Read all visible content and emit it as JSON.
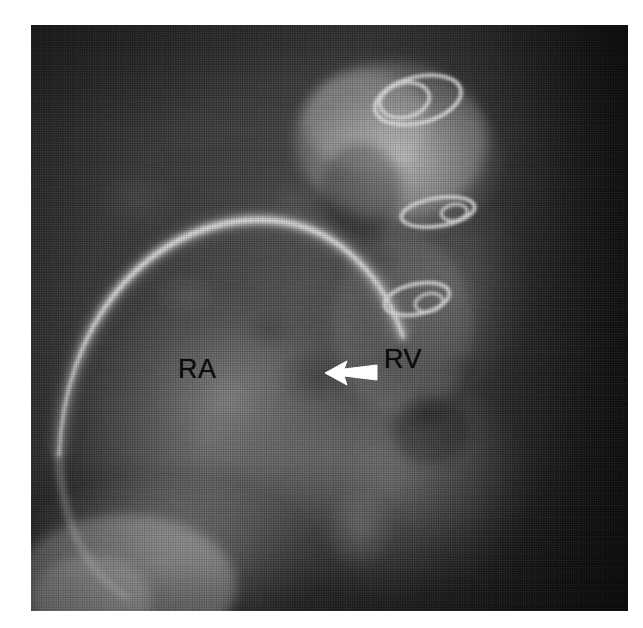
{
  "figure": {
    "kind": "radiograph",
    "modality_description": "grayscale angiocardiographic radiograph",
    "background_color": "#ffffff",
    "plate": {
      "x": 31,
      "y": 25,
      "width": 597,
      "height": 586,
      "base_color": "#3a3a3a"
    }
  },
  "annotations": {
    "labels": [
      {
        "id": "ra",
        "text": "RA",
        "meaning": "right atrium",
        "color": "#0b0b0b",
        "x": 147,
        "y": 331
      },
      {
        "id": "rv",
        "text": "RV",
        "meaning": "right ventricle",
        "color": "#0b0b0b",
        "x": 353,
        "y": 321
      }
    ],
    "arrow": {
      "id": "arrow-marker",
      "color": "#ffffff",
      "direction": "left",
      "x": 292,
      "y": 330,
      "width": 56,
      "height": 34
    }
  },
  "radiopaque_objects": [
    {
      "id": "wire-ring-1",
      "shape": "loop",
      "cx": 418,
      "cy": 100,
      "rx": 44,
      "ry": 23,
      "rotation": -14,
      "color": "#f2f2f2"
    },
    {
      "id": "wire-ring-2",
      "shape": "loop",
      "cx": 438,
      "cy": 212,
      "rx": 37,
      "ry": 14,
      "rotation": -9,
      "color": "#ededed"
    },
    {
      "id": "wire-ring-3",
      "shape": "loop",
      "cx": 417,
      "cy": 299,
      "rx": 33,
      "ry": 15,
      "rotation": -12,
      "color": "#ebebeb"
    }
  ],
  "structures": {
    "ra_border_arc": {
      "id": "ra-arc",
      "description": "bright curved right heart border",
      "color": "#f0f0f0"
    },
    "contrast_pool": {
      "description": "bright contrast-opacified region superiorly",
      "color": "#e8e8e8"
    },
    "diaphragm": {
      "description": "bright region lower left",
      "color": "#e0e0e0"
    }
  }
}
